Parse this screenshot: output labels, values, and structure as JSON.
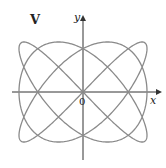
{
  "figure": {
    "panel_label": "V",
    "x_axis_label": "x",
    "y_axis_label": "y",
    "origin_label": "0",
    "curve_color": "#8a8a8a",
    "axis_color": "#333333"
  },
  "curve": {
    "type": "parametric-lissajous",
    "a": 3,
    "b": 4,
    "center_px": [
      83,
      92
    ],
    "half_width_px": 64,
    "half_height_px": 50
  }
}
